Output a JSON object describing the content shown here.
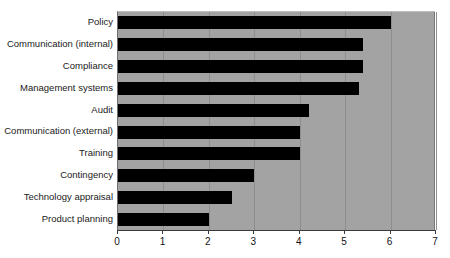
{
  "chart_data": {
    "type": "bar",
    "orientation": "horizontal",
    "title": "",
    "xlabel": "",
    "ylabel": "",
    "xlim": [
      0,
      7
    ],
    "grid": true,
    "legend": "none",
    "xticks": [
      "0",
      "1",
      "2",
      "3",
      "4",
      "5",
      "6",
      "7"
    ],
    "categories": [
      "Policy",
      "Communication (internal)",
      "Compliance",
      "Management systems",
      "Audit",
      "Communication (external)",
      "Training",
      "Contingency",
      "Technology appraisal",
      "Product planning"
    ],
    "values": [
      6.0,
      5.4,
      5.4,
      5.3,
      4.2,
      4.0,
      4.0,
      3.0,
      2.5,
      2.0
    ],
    "bar_color": "#000000",
    "plot_background": "#a3a3a3",
    "figure_background": "#ffffff"
  },
  "title_fragment": "▪"
}
